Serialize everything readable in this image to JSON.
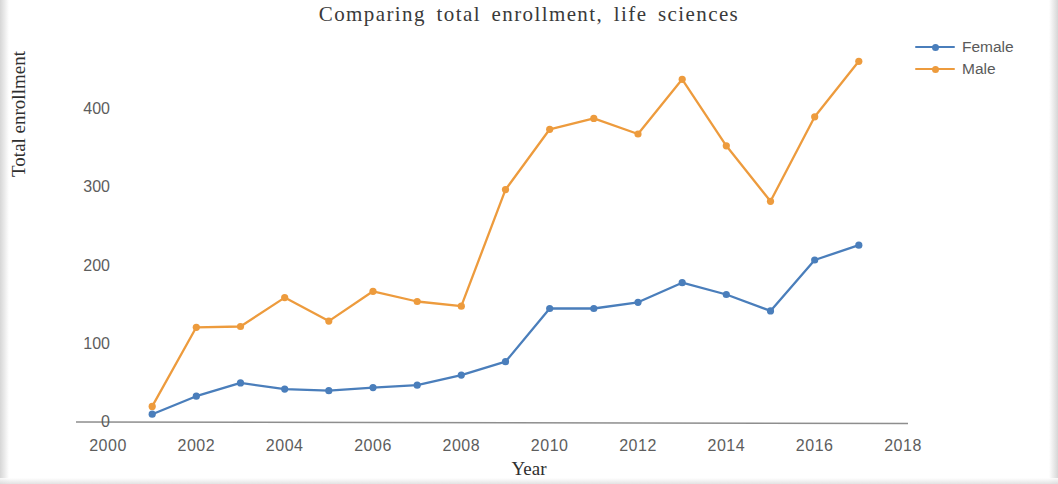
{
  "chart_data": {
    "type": "line",
    "title": "Comparing total enrollment, life sciences",
    "xlabel": "Year",
    "ylabel": "Total enrollment",
    "x": [
      2001,
      2002,
      2003,
      2004,
      2005,
      2006,
      2007,
      2008,
      2009,
      2010,
      2011,
      2012,
      2013,
      2014,
      2015,
      2016,
      2017
    ],
    "xlim": [
      2000,
      2018
    ],
    "ylim": [
      0,
      470
    ],
    "xticks": [
      "2000",
      "2002",
      "2004",
      "2006",
      "2008",
      "2010",
      "2012",
      "2014",
      "2016",
      "2018"
    ],
    "xtick_values": [
      2000,
      2002,
      2004,
      2006,
      2008,
      2010,
      2012,
      2014,
      2016,
      2018
    ],
    "yticks": [
      "0",
      "100",
      "200",
      "300",
      "400"
    ],
    "ytick_values": [
      0,
      100,
      200,
      300,
      400
    ],
    "grid": false,
    "legend_position": "top-right",
    "series": [
      {
        "name": "Female",
        "color": "#4a7ebb",
        "marker": "circle",
        "values": [
          10,
          33,
          50,
          42,
          40,
          44,
          47,
          60,
          77,
          145,
          145,
          153,
          178,
          163,
          142,
          207,
          226
        ]
      },
      {
        "name": "Male",
        "color": "#ed9b3d",
        "marker": "circle",
        "values": [
          20,
          121,
          122,
          159,
          129,
          167,
          154,
          148,
          297,
          374,
          388,
          368,
          438,
          353,
          282,
          390,
          461
        ]
      }
    ]
  },
  "legend": {
    "items": [
      {
        "label": "Female",
        "color": "#4a7ebb"
      },
      {
        "label": "Male",
        "color": "#ed9b3d"
      }
    ]
  }
}
